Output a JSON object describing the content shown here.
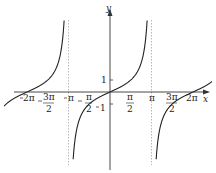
{
  "chart_data": {
    "type": "line",
    "title": "",
    "function": "y = tan x",
    "xlabel": "x",
    "ylabel": "y",
    "xlim": [
      -8.3,
      8.0
    ],
    "ylim": [
      -6.0,
      5.8
    ],
    "grid": false,
    "legend": null,
    "asymptotes": [
      "-3π/2",
      "-π/2",
      "π/2",
      "3π/2"
    ],
    "x_ticks": [
      {
        "value": -6.2832,
        "label": "-2π"
      },
      {
        "value": -4.7124,
        "label": "-3π/2"
      },
      {
        "value": -3.1416,
        "label": "-π"
      },
      {
        "value": -1.5708,
        "label": "-π/2"
      },
      {
        "value": 1.5708,
        "label": "π/2"
      },
      {
        "value": 3.1416,
        "label": "π"
      },
      {
        "value": 4.7124,
        "label": "3π/2"
      },
      {
        "value": 6.2832,
        "label": "2π"
      }
    ],
    "y_ticks": [
      {
        "value": 1,
        "label": "1"
      },
      {
        "value": -1,
        "label": "-1"
      }
    ],
    "series": [
      {
        "name": "tan x",
        "branches": [
          "(-5π/2, -3π/2)",
          "(-3π/2, -π/2)",
          "(-π/2, π/2)",
          "(π/2, 3π/2)",
          "(3π/2, 5π/2)"
        ]
      }
    ]
  },
  "labels": {
    "x_axis": "x",
    "y_axis": "y",
    "one": "1",
    "neg_one": "1",
    "neg_2pi": "2π",
    "neg_pi": "π",
    "pi": "π",
    "two_pi": "2π",
    "three_pi_num": "3π",
    "pi_num": "π",
    "two_den": "2"
  }
}
